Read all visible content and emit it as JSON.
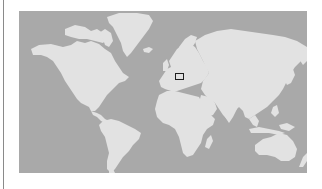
{
  "map": {
    "projection": "mercator-world",
    "colors": {
      "ocean": "#a9a9a9",
      "land": "#e2e2e2",
      "marker_stroke": "#1e1e1e",
      "left_rule": "#8a8a8a"
    },
    "marker": {
      "region": "Central Europe",
      "shape": "rectangle",
      "x": 156,
      "y": 62,
      "width": 8,
      "height": 6
    }
  }
}
